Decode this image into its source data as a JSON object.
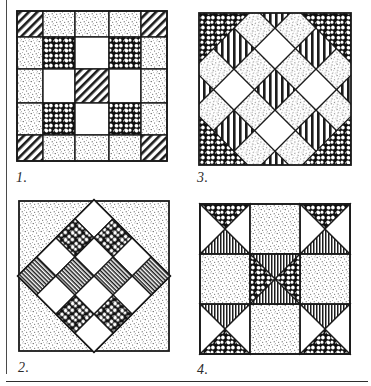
{
  "page": {
    "background_color": "#ffffff",
    "ink_color": "#1a1a1a",
    "rule_color": "#4a4a4a",
    "has_left_margin_rule": true,
    "has_bottom_rule": true
  },
  "legend": {
    "fabrics": [
      {
        "key": "white",
        "label": "plain white",
        "color": "#ffffff"
      },
      {
        "key": "stipple",
        "label": "light stipple dot",
        "color": "#f2f1ec"
      },
      {
        "key": "mottled",
        "label": "dark mottled print",
        "color": "#141414"
      },
      {
        "key": "diagonal",
        "label": "diagonal hatch",
        "color": "#2a2a2a"
      },
      {
        "key": "vertical",
        "label": "vertical stripe",
        "color": "#232323"
      },
      {
        "key": "horizontal",
        "label": "horizontal stripe",
        "color": "#232323"
      }
    ]
  },
  "blocks": [
    {
      "number": "1.",
      "name": "Nine Patch with Sashing and Corner Squares",
      "layout": "5x5 grid",
      "grid_rows": 5,
      "grid_cols": 5,
      "cells": [
        [
          "diagonal",
          "stipple",
          "stipple",
          "stipple",
          "diagonal"
        ],
        [
          "stipple",
          "mottled",
          "white",
          "mottled",
          "stipple"
        ],
        [
          "stipple",
          "white",
          "diagonal",
          "white",
          "stipple"
        ],
        [
          "stipple",
          "mottled",
          "white",
          "mottled",
          "stipple"
        ],
        [
          "diagonal",
          "stipple",
          "stipple",
          "stipple",
          "diagonal"
        ]
      ]
    },
    {
      "number": "2.",
      "name": "Single Irish Chain set on point",
      "layout": "4x4 checkerboard rotated 45 degrees on stippled background",
      "grid_rows": 4,
      "grid_cols": 4,
      "background": "stipple",
      "cells": [
        [
          "white",
          "mottled",
          "white",
          "horizontal"
        ],
        [
          "mottled",
          "white",
          "horizontal",
          "white"
        ],
        [
          "white",
          "horizontal",
          "white",
          "mottled"
        ],
        [
          "horizontal",
          "white",
          "mottled",
          "white"
        ]
      ]
    },
    {
      "number": "3.",
      "name": "Diagonal Lattice / Double Irish Chain on point",
      "layout": "diagonal lattice of squares set on point",
      "grid_rows": 5,
      "grid_cols": 5,
      "cells": [
        [
          "diagonal",
          "stipple",
          "diagonal",
          "stipple",
          "diagonal"
        ],
        [
          "stipple",
          "white",
          "stipple",
          "white",
          "stipple"
        ],
        [
          "diagonal",
          "stipple",
          "diagonal",
          "stipple",
          "diagonal"
        ],
        [
          "stipple",
          "white",
          "stipple",
          "white",
          "stipple"
        ],
        [
          "diagonal",
          "stipple",
          "diagonal",
          "stipple",
          "diagonal"
        ]
      ],
      "edge_fill": "mottled"
    },
    {
      "number": "4.",
      "name": "Hourglass Nine Patch",
      "layout": "3x3 grid of hourglass and plain units",
      "grid_rows": 3,
      "grid_cols": 3,
      "units": [
        [
          "hourglass",
          "stipple",
          "hourglass"
        ],
        [
          "stipple",
          "hourglass-rotated",
          "stipple"
        ],
        [
          "hourglass",
          "stipple",
          "hourglass"
        ]
      ],
      "hourglass_triangles": {
        "top": "mottled",
        "bottom": "vertical",
        "left": "white",
        "right": "white"
      },
      "center_triangles": {
        "top": "vertical",
        "bottom": "vertical",
        "left": "mottled",
        "right": "mottled"
      }
    }
  ]
}
